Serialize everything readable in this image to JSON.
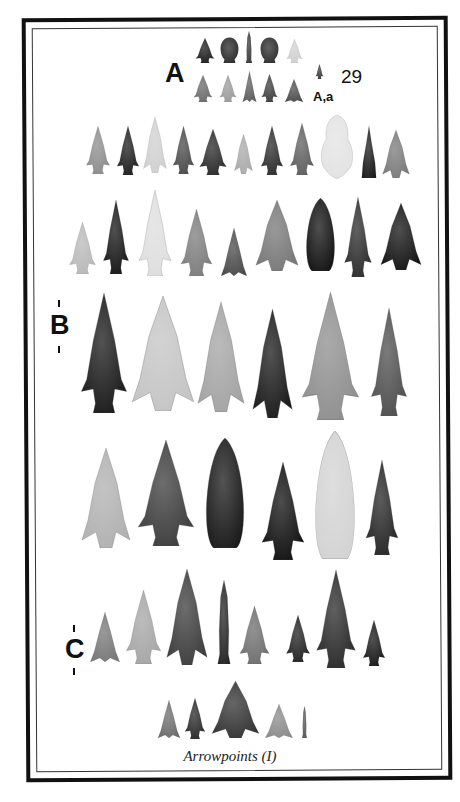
{
  "plate": {
    "number": "29",
    "caption": "Arrowpoints (I)",
    "labels": {
      "A": "A",
      "A_a": "A,a",
      "B": "B",
      "C": "C"
    }
  },
  "colors": {
    "frame": "#111111",
    "background": "#ffffff",
    "text": "#111111"
  },
  "rows": [
    {
      "name": "row-A-top",
      "points": [
        {
          "x": 194,
          "y": 38,
          "w": 22,
          "h": 25,
          "tone": "#1c1c1c",
          "shape": "stemmed"
        },
        {
          "x": 219,
          "y": 37,
          "w": 21,
          "h": 26,
          "tone": "#2a2a2a",
          "shape": "round"
        },
        {
          "x": 243,
          "y": 31,
          "w": 12,
          "h": 32,
          "tone": "#3a3a3a",
          "shape": "lance"
        },
        {
          "x": 259,
          "y": 37,
          "w": 21,
          "h": 26,
          "tone": "#2e2e2e",
          "shape": "round"
        },
        {
          "x": 285,
          "y": 39,
          "w": 19,
          "h": 24,
          "tone": "#cfcfcf",
          "shape": "stemmed"
        }
      ]
    },
    {
      "name": "row-A-bottom",
      "points": [
        {
          "x": 192,
          "y": 75,
          "w": 22,
          "h": 27,
          "tone": "#6a6a6a",
          "shape": "stemmed"
        },
        {
          "x": 218,
          "y": 75,
          "w": 20,
          "h": 27,
          "tone": "#9a9a9a",
          "shape": "stemmed"
        },
        {
          "x": 242,
          "y": 71,
          "w": 15,
          "h": 31,
          "tone": "#5c5c5c",
          "shape": "triangle"
        },
        {
          "x": 260,
          "y": 74,
          "w": 19,
          "h": 28,
          "tone": "#3e3e3e",
          "shape": "stemmed"
        },
        {
          "x": 284,
          "y": 79,
          "w": 20,
          "h": 23,
          "tone": "#4c4c4c",
          "shape": "triangle"
        },
        {
          "x": 315,
          "y": 64,
          "w": 9,
          "h": 15,
          "tone": "#3a3a3a",
          "shape": "stemmed"
        }
      ]
    },
    {
      "name": "row-2",
      "points": [
        {
          "x": 84,
          "y": 126,
          "w": 28,
          "h": 48,
          "tone": "#8c8c8c",
          "shape": "stemmed"
        },
        {
          "x": 115,
          "y": 126,
          "w": 26,
          "h": 49,
          "tone": "#1e1e1e",
          "shape": "stemmed"
        },
        {
          "x": 143,
          "y": 117,
          "w": 24,
          "h": 56,
          "tone": "#d0d0d0",
          "shape": "corner"
        },
        {
          "x": 171,
          "y": 126,
          "w": 25,
          "h": 48,
          "tone": "#4a4a4a",
          "shape": "stemmed"
        },
        {
          "x": 197,
          "y": 129,
          "w": 32,
          "h": 46,
          "tone": "#2a2a2a",
          "shape": "stemmed"
        },
        {
          "x": 234,
          "y": 134,
          "w": 19,
          "h": 40,
          "tone": "#a9a9a9",
          "shape": "corner"
        },
        {
          "x": 259,
          "y": 126,
          "w": 26,
          "h": 49,
          "tone": "#2c2c2c",
          "shape": "stemmed"
        },
        {
          "x": 288,
          "y": 123,
          "w": 28,
          "h": 52,
          "tone": "#5e5e5e",
          "shape": "stemmed"
        },
        {
          "x": 319,
          "y": 115,
          "w": 36,
          "h": 64,
          "tone": "#e3e3e3",
          "shape": "blob"
        },
        {
          "x": 359,
          "y": 126,
          "w": 20,
          "h": 52,
          "tone": "#1c1c1c",
          "shape": "lanceTri"
        },
        {
          "x": 382,
          "y": 130,
          "w": 28,
          "h": 48,
          "tone": "#7a7a7a",
          "shape": "corner"
        }
      ]
    },
    {
      "name": "row-3",
      "points": [
        {
          "x": 67,
          "y": 222,
          "w": 31,
          "h": 52,
          "tone": "#b8b8b8",
          "shape": "stemmed"
        },
        {
          "x": 101,
          "y": 200,
          "w": 30,
          "h": 74,
          "tone": "#161616",
          "shape": "stemmed"
        },
        {
          "x": 136,
          "y": 190,
          "w": 38,
          "h": 86,
          "tone": "#dedede",
          "shape": "stemmed"
        },
        {
          "x": 178,
          "y": 209,
          "w": 37,
          "h": 67,
          "tone": "#7c7c7c",
          "shape": "stemmed"
        },
        {
          "x": 220,
          "y": 228,
          "w": 28,
          "h": 48,
          "tone": "#4a4a4a",
          "shape": "triangle"
        },
        {
          "x": 255,
          "y": 200,
          "w": 44,
          "h": 71,
          "tone": "#777777",
          "shape": "corner"
        },
        {
          "x": 304,
          "y": 198,
          "w": 33,
          "h": 73,
          "tone": "#141414",
          "shape": "lanceBlunt"
        },
        {
          "x": 342,
          "y": 197,
          "w": 32,
          "h": 80,
          "tone": "#2c2c2c",
          "shape": "stemmed"
        },
        {
          "x": 380,
          "y": 203,
          "w": 42,
          "h": 67,
          "tone": "#141414",
          "shape": "corner"
        }
      ]
    },
    {
      "name": "row-B",
      "points": [
        {
          "x": 77,
          "y": 293,
          "w": 54,
          "h": 120,
          "tone": "#191919",
          "shape": "stemmed"
        },
        {
          "x": 131,
          "y": 296,
          "w": 64,
          "h": 115,
          "tone": "#c4c4c4",
          "shape": "corner"
        },
        {
          "x": 197,
          "y": 302,
          "w": 48,
          "h": 110,
          "tone": "#a3a3a3",
          "shape": "corner"
        },
        {
          "x": 252,
          "y": 309,
          "w": 41,
          "h": 109,
          "tone": "#1a1a1a",
          "shape": "corner"
        },
        {
          "x": 297,
          "y": 292,
          "w": 67,
          "h": 128,
          "tone": "#8e8e8e",
          "shape": "stemmed"
        },
        {
          "x": 368,
          "y": 308,
          "w": 42,
          "h": 108,
          "tone": "#4e4e4e",
          "shape": "stemmed"
        }
      ]
    },
    {
      "name": "row-4",
      "points": [
        {
          "x": 81,
          "y": 448,
          "w": 50,
          "h": 100,
          "tone": "#b0b0b0",
          "shape": "corner"
        },
        {
          "x": 133,
          "y": 440,
          "w": 66,
          "h": 106,
          "tone": "#3c3c3c",
          "shape": "stemmed"
        },
        {
          "x": 203,
          "y": 438,
          "w": 44,
          "h": 110,
          "tone": "#1a1a1a",
          "shape": "lanceBlunt"
        },
        {
          "x": 258,
          "y": 462,
          "w": 50,
          "h": 98,
          "tone": "#111111",
          "shape": "stemmed"
        },
        {
          "x": 312,
          "y": 431,
          "w": 46,
          "h": 128,
          "tone": "#d3d3d3",
          "shape": "lanceBlunt"
        },
        {
          "x": 363,
          "y": 460,
          "w": 38,
          "h": 95,
          "tone": "#262626",
          "shape": "stemmed"
        }
      ]
    },
    {
      "name": "row-C",
      "points": [
        {
          "x": 89,
          "y": 612,
          "w": 32,
          "h": 50,
          "tone": "#777777",
          "shape": "triangle"
        },
        {
          "x": 123,
          "y": 590,
          "w": 41,
          "h": 74,
          "tone": "#a5a5a5",
          "shape": "stemmed"
        },
        {
          "x": 166,
          "y": 569,
          "w": 42,
          "h": 96,
          "tone": "#3c3c3c",
          "shape": "corner"
        },
        {
          "x": 212,
          "y": 580,
          "w": 24,
          "h": 84,
          "tone": "#262626",
          "shape": "lance"
        },
        {
          "x": 237,
          "y": 606,
          "w": 35,
          "h": 58,
          "tone": "#6e6e6e",
          "shape": "stemmed"
        },
        {
          "x": 284,
          "y": 615,
          "w": 28,
          "h": 47,
          "tone": "#222222",
          "shape": "stemmed"
        },
        {
          "x": 313,
          "y": 570,
          "w": 46,
          "h": 98,
          "tone": "#2a2a2a",
          "shape": "stemmed"
        },
        {
          "x": 361,
          "y": 620,
          "w": 26,
          "h": 46,
          "tone": "#181818",
          "shape": "stemmed"
        }
      ]
    },
    {
      "name": "row-bottom",
      "points": [
        {
          "x": 157,
          "y": 700,
          "w": 24,
          "h": 38,
          "tone": "#6c6c6c",
          "shape": "triangle"
        },
        {
          "x": 183,
          "y": 698,
          "w": 24,
          "h": 41,
          "tone": "#2a2a2a",
          "shape": "stemmed"
        },
        {
          "x": 211,
          "y": 681,
          "w": 49,
          "h": 57,
          "tone": "#333333",
          "shape": "corner"
        },
        {
          "x": 264,
          "y": 704,
          "w": 30,
          "h": 34,
          "tone": "#8a8a8a",
          "shape": "triangle"
        },
        {
          "x": 300,
          "y": 706,
          "w": 9,
          "h": 32,
          "tone": "#555555",
          "shape": "lance"
        }
      ]
    }
  ]
}
